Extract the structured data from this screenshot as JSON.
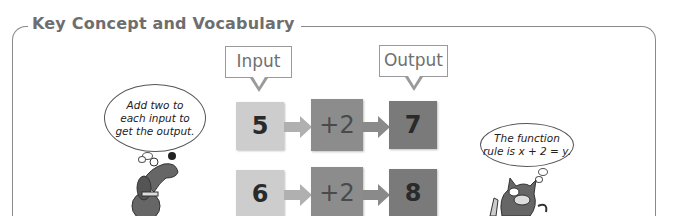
{
  "heading": "Key Concept and Vocabulary",
  "labels": {
    "input": "Input",
    "output": "Output"
  },
  "rows": [
    {
      "input": "5",
      "rule": "+2",
      "output": "7"
    },
    {
      "input": "6",
      "rule": "+2",
      "output": "8"
    }
  ],
  "colors": {
    "frame": "#8a8a8a",
    "input_box": "#cdcdcd",
    "rule_box": "#8c8c8c",
    "output_box": "#7a7a7a",
    "arrow": "#a8a8a8"
  },
  "dog_bubble": {
    "line1": "Add two to",
    "line2": "each input to",
    "line3": "get the output."
  },
  "cat_bubble": {
    "line1": "The function",
    "line2": "rule is x + 2 = y."
  },
  "icons": {
    "dog": "cartoon-dog",
    "cat": "cartoon-cat"
  }
}
